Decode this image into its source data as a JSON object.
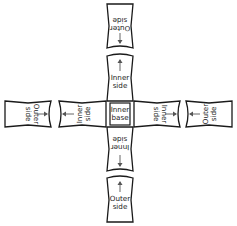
{
  "diagram": {
    "type": "cross-layout flap diagram",
    "center": {
      "line1": "Inner",
      "line2": "base"
    },
    "top": {
      "outer": {
        "line1": "Outer",
        "line2": "side",
        "arrow": "toward-center"
      },
      "inner": {
        "line1": "Inner",
        "line2": "side",
        "arrow": "away-from-center"
      }
    },
    "bottom": {
      "inner": {
        "line1": "Inner",
        "line2": "side",
        "arrow": "away-from-center"
      },
      "outer": {
        "line1": "Outer",
        "line2": "side",
        "arrow": "toward-center"
      }
    },
    "left": {
      "outer": {
        "line1": "Outer",
        "line2": "side",
        "arrow": "toward-center"
      },
      "inner": {
        "line1": "Inner",
        "line2": "side",
        "arrow": "away-from-center"
      }
    },
    "right": {
      "inner": {
        "line1": "Inner",
        "line2": "side",
        "arrow": "away-from-center"
      },
      "outer": {
        "line1": "Outer",
        "line2": "side",
        "arrow": "toward-center"
      }
    },
    "colors": {
      "stroke": "#1a1a1a",
      "arrow": "#555555",
      "background": "#ffffff"
    }
  }
}
